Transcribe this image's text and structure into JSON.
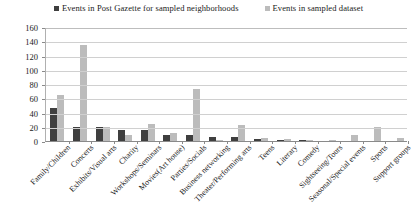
{
  "chart_data": {
    "type": "bar",
    "title": "",
    "xlabel": "",
    "ylabel": "",
    "ylim": [
      0,
      160
    ],
    "ytick_step": 20,
    "yticks": [
      "0",
      "20",
      "40",
      "60",
      "80",
      "100",
      "120",
      "140",
      "160"
    ],
    "grid": true,
    "legend_position": "top-center",
    "categories": [
      "Family/Children",
      "Concerts",
      "Exhibits/Visual arts",
      "Charity",
      "Workshops/Seminars",
      "Movies(Art house)",
      "Parties/Socials",
      "Business networking",
      "Theater/Performing arts",
      "Teens",
      "Literary",
      "Comedy",
      "Sightseeing/Tours",
      "Seasonal/Special events",
      "Sports",
      "Support groups"
    ],
    "series": [
      {
        "name": "Events in Post Gazette for sampled neighborhoods",
        "color": "#3f3f3f",
        "values": [
          47,
          19,
          19,
          16,
          16,
          9,
          9,
          6,
          6,
          3,
          2,
          1,
          0,
          0,
          0,
          0
        ]
      },
      {
        "name": "Events in sampled dataset",
        "color": "#bcbcbc",
        "values": [
          65,
          135,
          20,
          9,
          24,
          11,
          73,
          1,
          22,
          4,
          3,
          1,
          2,
          8,
          20,
          4
        ]
      }
    ]
  },
  "legend": {
    "entries": [
      {
        "label": "Events in Post Gazette for sampled neighborhoods",
        "color": "#3f3f3f"
      },
      {
        "label": "Events in sampled dataset",
        "color": "#bcbcbc"
      }
    ]
  }
}
